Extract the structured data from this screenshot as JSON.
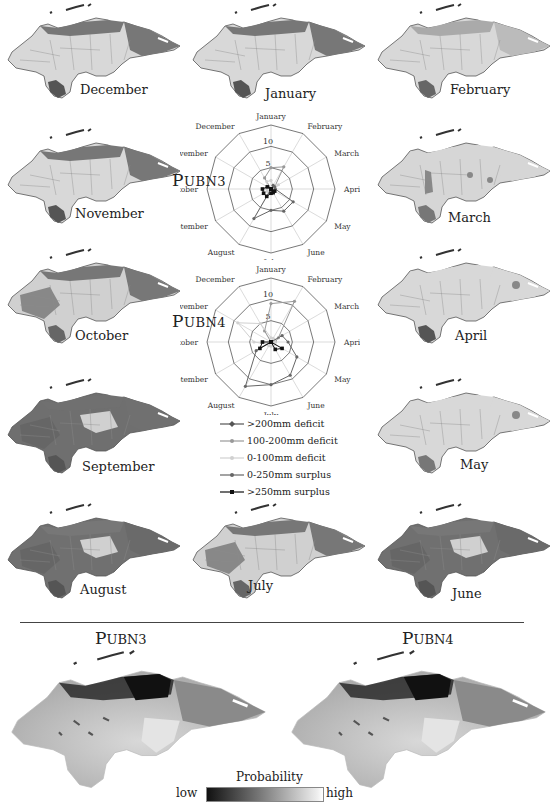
{
  "figure": {
    "months_maps": [
      {
        "id": "december",
        "label": "December",
        "x": 0,
        "y": 0,
        "lx": 80,
        "ly": 90,
        "tone": "north"
      },
      {
        "id": "january",
        "label": "January",
        "x": 185,
        "y": 0,
        "lx": 265,
        "ly": 94,
        "tone": "north"
      },
      {
        "id": "february",
        "label": "February",
        "x": 370,
        "y": 0,
        "lx": 450,
        "ly": 90,
        "tone": "lightnorth"
      },
      {
        "id": "november",
        "label": "November",
        "x": 0,
        "y": 125,
        "lx": 75,
        "ly": 214,
        "tone": "north"
      },
      {
        "id": "march",
        "label": "March",
        "x": 370,
        "y": 125,
        "lx": 448,
        "ly": 218,
        "tone": "spots"
      },
      {
        "id": "october",
        "label": "October",
        "x": 0,
        "y": 245,
        "lx": 75,
        "ly": 336,
        "tone": "mixed"
      },
      {
        "id": "april",
        "label": "April",
        "x": 370,
        "y": 245,
        "lx": 455,
        "ly": 336,
        "tone": "light"
      },
      {
        "id": "september",
        "label": "September",
        "x": 0,
        "y": 375,
        "lx": 82,
        "ly": 467,
        "tone": "dark"
      },
      {
        "id": "may",
        "label": "May",
        "x": 370,
        "y": 375,
        "lx": 460,
        "ly": 465,
        "tone": "lightsouth"
      },
      {
        "id": "august",
        "label": "August",
        "x": 0,
        "y": 500,
        "lx": 80,
        "ly": 590,
        "tone": "darkmix"
      },
      {
        "id": "july",
        "label": "July",
        "x": 185,
        "y": 500,
        "lx": 248,
        "ly": 586,
        "tone": "mixed"
      },
      {
        "id": "june",
        "label": "June",
        "x": 370,
        "y": 500,
        "lx": 452,
        "ly": 594,
        "tone": "darkmix"
      }
    ],
    "radar_month_labels": [
      "January",
      "February",
      "March",
      "April",
      "May",
      "June",
      "July",
      "August",
      "September",
      "October",
      "November",
      "December"
    ],
    "radar_scale_labels": [
      "5",
      "10"
    ],
    "legend": [
      {
        "label": ">200mm deficit",
        "color": "#555555",
        "marker": "diamond"
      },
      {
        "label": "100-200mm deficit",
        "color": "#999999",
        "marker": "circle"
      },
      {
        "label": "0-100mm deficit",
        "color": "#d0d0d0",
        "marker": "circle"
      },
      {
        "label": "0-250mm surplus",
        "color": "#666666",
        "marker": "circle"
      },
      {
        "label": ">250mm surplus",
        "color": "#111111",
        "marker": "square"
      }
    ],
    "probability_maps": [
      {
        "title_big": "P",
        "title_small": "UBN3",
        "x": 0,
        "y": 645
      },
      {
        "title_big": "P",
        "title_small": "UBN4",
        "x": 280,
        "y": 645
      }
    ],
    "colorbar": {
      "title": "Probability",
      "low": "low",
      "high": "high"
    }
  },
  "chart_data": [
    {
      "type": "radar",
      "title": "PUBN3",
      "categories": [
        "January",
        "February",
        "March",
        "April",
        "May",
        "June",
        "July",
        "August",
        "September",
        "October",
        "November",
        "December"
      ],
      "rmax": 15,
      "ticks": [
        5,
        10
      ],
      "series": [
        {
          "name": ">200mm deficit",
          "values": [
            0,
            0,
            0,
            0,
            0,
            0,
            0,
            0,
            0,
            0,
            0,
            0
          ]
        },
        {
          "name": "100-200mm deficit",
          "values": [
            5,
            6,
            1,
            1,
            0,
            0,
            0,
            0,
            0,
            0,
            0,
            3
          ]
        },
        {
          "name": "0-100mm deficit",
          "values": [
            2,
            1,
            2,
            1,
            1,
            1,
            1,
            1,
            1,
            1,
            1,
            2
          ]
        },
        {
          "name": "0-250mm surplus",
          "values": [
            0,
            1,
            1,
            1,
            6,
            6,
            5,
            8,
            0,
            0,
            0,
            0
          ]
        },
        {
          "name": ">250mm surplus",
          "values": [
            0,
            0,
            0,
            0,
            1,
            1,
            1,
            2,
            2,
            2,
            1,
            0
          ]
        }
      ]
    },
    {
      "type": "radar",
      "title": "PUBN4",
      "categories": [
        "January",
        "February",
        "March",
        "April",
        "May",
        "June",
        "July",
        "August",
        "September",
        "October",
        "November",
        "December"
      ],
      "rmax": 15,
      "ticks": [
        5,
        10
      ],
      "series": [
        {
          "name": ">200mm deficit",
          "values": [
            0,
            0,
            0,
            0,
            0,
            0,
            0,
            0,
            0,
            0,
            0,
            0
          ]
        },
        {
          "name": "100-200mm deficit",
          "values": [
            9,
            11,
            2,
            1,
            0,
            0,
            0,
            0,
            0,
            0,
            0,
            3
          ]
        },
        {
          "name": "0-100mm deficit",
          "values": [
            1,
            1,
            1,
            1,
            1,
            1,
            1,
            1,
            1,
            4,
            9,
            5
          ]
        },
        {
          "name": "0-250mm surplus",
          "values": [
            0,
            0,
            3,
            4,
            7,
            9,
            10,
            12,
            4,
            0,
            0,
            0
          ]
        },
        {
          "name": ">250mm surplus",
          "values": [
            0,
            0,
            0,
            0,
            3,
            2,
            0,
            0,
            3,
            2,
            0,
            0
          ]
        }
      ]
    }
  ]
}
